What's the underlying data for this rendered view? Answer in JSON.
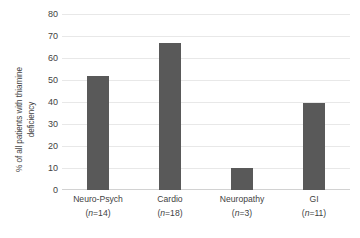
{
  "chart_data": {
    "type": "bar",
    "title": "",
    "xlabel": "",
    "ylabel": "% of all patients with thiamine deficiency",
    "ylabel_line1": "% of all patients with thiamine",
    "ylabel_line2": "deficiency",
    "categories": [
      "Neuro-Psych",
      "Cardio",
      "Neuropathy",
      "GI"
    ],
    "values": [
      52,
      67,
      10,
      39.6
    ],
    "ylim": [
      0,
      80
    ],
    "ytick_values": [
      0,
      10,
      20,
      30,
      40,
      50,
      60,
      70,
      80
    ],
    "ytick_labels": [
      "0",
      "10",
      "20",
      "30",
      "40",
      "50",
      "60",
      "70",
      "80"
    ],
    "grid": true,
    "legend": false,
    "bar_color": "#595959",
    "gridline_color": "#e8e8e8",
    "axis_color": "#d2d2d2",
    "background_color": "#ffffff",
    "bars": [
      {
        "category": "Neuro-Psych",
        "value": 52,
        "n_prefix": "(",
        "n_italic": "n",
        "n_suffix": "=14)",
        "label_line1": "Neuro-Psych",
        "label_line2": "(n=14)"
      },
      {
        "category": "Cardio",
        "value": 67,
        "n_prefix": "(",
        "n_italic": "n",
        "n_suffix": "=18)",
        "label_line1": "Cardio",
        "label_line2": "(n=18)"
      },
      {
        "category": "Neuropathy",
        "value": 10,
        "n_prefix": "(",
        "n_italic": "n",
        "n_suffix": "=3)",
        "label_line1": "Neuropathy",
        "label_line2": "(n=3)"
      },
      {
        "category": "GI",
        "value": 39.6,
        "n_prefix": "(",
        "n_italic": "n",
        "n_suffix": "=11)",
        "label_line1": "GI",
        "label_line2": "(n=11)"
      }
    ]
  }
}
